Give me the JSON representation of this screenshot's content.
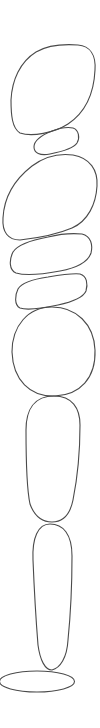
{
  "illustration": {
    "title": "Stacked stones line drawing",
    "background": "#ffffff",
    "stroke_color": "#4a4a4a",
    "stroke_width": 1.1,
    "stones": [
      {
        "id": "stone-1",
        "shape": "large tilted oval",
        "bbox": [
          11,
          43,
          95,
          135
        ]
      },
      {
        "id": "stone-2",
        "shape": "small flat oval",
        "bbox": [
          33,
          127,
          79,
          155
        ]
      },
      {
        "id": "stone-3",
        "shape": "large tilted oval",
        "bbox": [
          2,
          153,
          97,
          240
        ]
      },
      {
        "id": "stone-4",
        "shape": "flat oval",
        "bbox": [
          9,
          233,
          92,
          275
        ]
      },
      {
        "id": "stone-5",
        "shape": "flat oval",
        "bbox": [
          15,
          273,
          88,
          310
        ]
      },
      {
        "id": "stone-6",
        "shape": "round stone",
        "bbox": [
          12,
          306,
          95,
          396
        ]
      },
      {
        "id": "stone-7",
        "shape": "tall rounded rectangle",
        "bbox": [
          26,
          396,
          80,
          523
        ]
      },
      {
        "id": "stone-8",
        "shape": "tall narrow stone",
        "bbox": [
          32,
          523,
          73,
          670
        ]
      },
      {
        "id": "base",
        "shape": "flat base ellipse",
        "bbox": [
          0,
          671,
          75,
          692
        ]
      }
    ]
  }
}
